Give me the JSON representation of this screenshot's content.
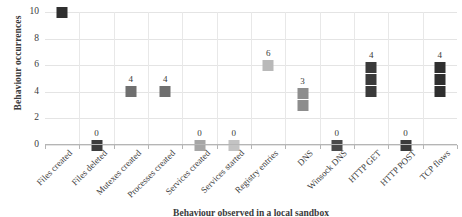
{
  "chart_data": {
    "type": "scatter",
    "title": "",
    "xlabel": "Behaviour observed in a local sandbox",
    "ylabel": "Behaviour occurrences",
    "ylim": [
      0,
      10
    ],
    "yticks": [
      0,
      2,
      4,
      6,
      8,
      10
    ],
    "grid": true,
    "legend": "none",
    "categories": [
      "Files created",
      "Files deleted",
      "Mutexes created",
      "Processes created",
      "Services created",
      "Services started",
      "Registry entries",
      "DNS",
      "Winsock DNS",
      "HTTP GET",
      "HTTP POST",
      "TCP flows"
    ],
    "values": [
      10,
      0,
      4,
      4,
      0,
      0,
      6,
      3,
      0,
      4,
      0,
      4
    ],
    "point_labels": [
      "",
      "0",
      "4",
      "4",
      "0",
      "0",
      "6",
      "3",
      "0",
      "4",
      "0",
      "4"
    ],
    "marker_colors": [
      "#2f2f2f",
      "#3c3c3c",
      "#6f6f6f",
      "#6f6f6f",
      "#a6a6a6",
      "#c3c3c3",
      "#b9b9b9",
      "#8d8d8d",
      "#4a4a4a",
      "#3a3a3a",
      "#3a3a3a",
      "#2f2f2f"
    ],
    "marker_segments": [
      1,
      1,
      1,
      1,
      1,
      1,
      1,
      2,
      1,
      3,
      1,
      3
    ],
    "marker_shape": "square"
  }
}
